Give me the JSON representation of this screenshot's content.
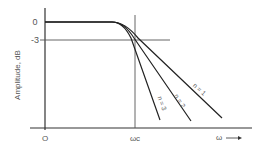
{
  "diagram": {
    "y_axis_label": "Amplitude, dB",
    "y_ticks": [
      "0",
      "-3"
    ],
    "x_origin_label": "O",
    "x_marker_label": "ωc",
    "x_axis_label": "ω",
    "x_axis_arrow": "→",
    "curves": [
      {
        "label": "n = 1",
        "order": 1
      },
      {
        "label": "n = 2",
        "order": 2
      },
      {
        "label": "n = 3",
        "order": 3
      }
    ],
    "colors": {
      "line": "#333333",
      "text": "#555555",
      "background": "#ffffff"
    }
  }
}
